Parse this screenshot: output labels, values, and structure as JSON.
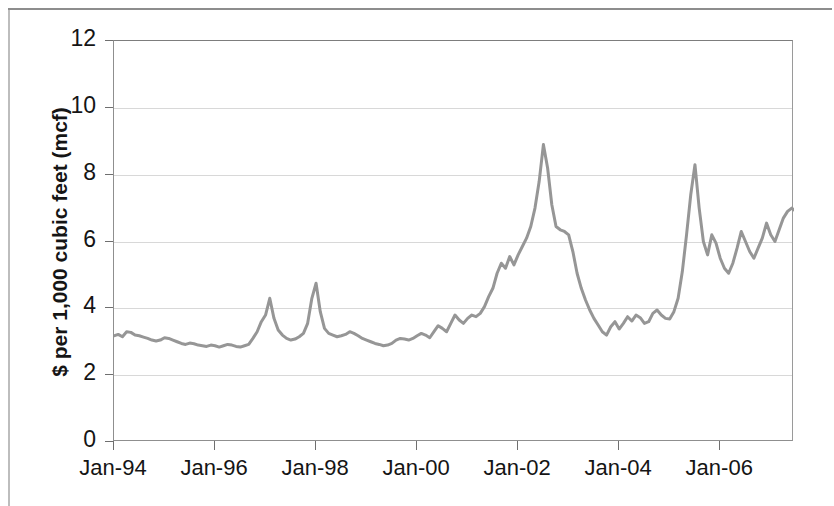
{
  "chart_data": {
    "type": "line",
    "title": "",
    "subtitle": "",
    "xlabel": "",
    "ylabel": "$ per 1,000 cubic feet (mcf)",
    "ylim": [
      0,
      12
    ],
    "yticks": [
      0,
      2,
      4,
      6,
      8,
      10,
      12
    ],
    "ytick_labels": [
      "0",
      "2",
      "4",
      "6",
      "8",
      "10",
      "12"
    ],
    "xtick_labels": [
      "Jan-94",
      "Jan-96",
      "Jan-98",
      "Jan-00",
      "Jan-02",
      "Jan-04",
      "Jan-06"
    ],
    "xtick_x": [
      1994.0,
      1996.0,
      1998.0,
      2000.0,
      2002.0,
      2004.0,
      2006.0
    ],
    "xlim": [
      1994.0,
      2007.46
    ],
    "grid": "horizontal",
    "legend": "none",
    "series": [
      {
        "name": "Natural gas price",
        "color": "#969696",
        "line_width": 3,
        "x_start": 1994.0,
        "x_step": 0.08333,
        "values": [
          3.18,
          3.22,
          3.15,
          3.3,
          3.28,
          3.2,
          3.18,
          3.14,
          3.1,
          3.05,
          3.02,
          3.05,
          3.12,
          3.1,
          3.05,
          3.0,
          2.95,
          2.92,
          2.96,
          2.94,
          2.9,
          2.88,
          2.86,
          2.9,
          2.88,
          2.84,
          2.88,
          2.92,
          2.9,
          2.86,
          2.84,
          2.88,
          2.92,
          3.1,
          3.3,
          3.6,
          3.8,
          4.3,
          3.7,
          3.35,
          3.2,
          3.1,
          3.05,
          3.08,
          3.15,
          3.25,
          3.55,
          4.3,
          4.75,
          3.9,
          3.4,
          3.25,
          3.2,
          3.15,
          3.18,
          3.22,
          3.3,
          3.25,
          3.18,
          3.1,
          3.05,
          3.0,
          2.95,
          2.92,
          2.88,
          2.9,
          2.95,
          3.05,
          3.1,
          3.08,
          3.05,
          3.1,
          3.18,
          3.25,
          3.2,
          3.12,
          3.3,
          3.48,
          3.4,
          3.3,
          3.55,
          3.8,
          3.65,
          3.55,
          3.7,
          3.8,
          3.75,
          3.85,
          4.05,
          4.35,
          4.6,
          5.05,
          5.35,
          5.2,
          5.55,
          5.3,
          5.6,
          5.85,
          6.1,
          6.45,
          7.0,
          7.8,
          8.9,
          8.2,
          7.1,
          6.45,
          6.35,
          6.3,
          6.2,
          5.7,
          5.05,
          4.6,
          4.25,
          3.95,
          3.7,
          3.5,
          3.3,
          3.2,
          3.45,
          3.6,
          3.38,
          3.55,
          3.75,
          3.62,
          3.8,
          3.72,
          3.55,
          3.6,
          3.85,
          3.95,
          3.8,
          3.7,
          3.68,
          3.9,
          4.3,
          5.1,
          6.2,
          7.4,
          8.3,
          7.0,
          6.0,
          5.6,
          6.2,
          5.95,
          5.5,
          5.2,
          5.05,
          5.35,
          5.8,
          6.3,
          6.0,
          5.7,
          5.5,
          5.8,
          6.1,
          6.55,
          6.2,
          6.0,
          6.35,
          6.7,
          6.9,
          7.0,
          6.9,
          7.05,
          7.3,
          7.25,
          7.0,
          6.85,
          6.95,
          7.3,
          8.0,
          9.4,
          10.8,
          12.0,
          11.4,
          11.0,
          9.5,
          8.0,
          7.0,
          6.6,
          6.9,
          6.2,
          5.7,
          6.5,
          7.4,
          7.1,
          7.8,
          8.45,
          8.2,
          7.85,
          8.1,
          7.95,
          7.6
        ],
        "annotations": {
          "peak_2001": 8.9,
          "peak_2003": 8.3,
          "peak_2005": 12.0,
          "trough_1995": 2.84,
          "trough_2002": 3.2
        }
      }
    ]
  }
}
